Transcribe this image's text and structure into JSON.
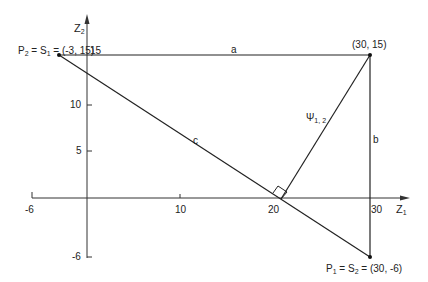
{
  "axes": {
    "x_label": "Z",
    "x_label_sub": "1",
    "y_label": "Z",
    "y_label_sub": "2",
    "x_ticks": [
      "-6",
      "10",
      "20",
      "30"
    ],
    "y_ticks": [
      "15",
      "10",
      "5",
      "-6"
    ]
  },
  "points": {
    "p2": {
      "name": "P",
      "name_sub": "2",
      "eq": " = S",
      "eq_sub": "1",
      "coords": " = (-3, 15)"
    },
    "corner": {
      "coords": "(30, 15)"
    },
    "p1": {
      "name": "P",
      "name_sub": "1",
      "eq": " =  S",
      "eq_sub": "2",
      "coords": " = (30, -6)"
    }
  },
  "segments": {
    "a": "a",
    "b": "b",
    "c": "c",
    "psi": "Ψ",
    "psi_sub": "1, 2"
  },
  "colors": {
    "line": "#222222",
    "background": "#ffffff"
  }
}
